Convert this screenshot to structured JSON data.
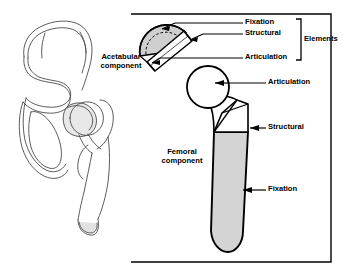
{
  "figure": {
    "background_color": "#ffffff",
    "line_color": "#000000",
    "shade_color": "#d6d6d6",
    "bone_line_color": "#444444"
  },
  "left_panel": {
    "name": "hemipelvis-and-proximal-femur-line-drawing",
    "description": "Outline drawing of hemipelvis with acetabulum and proximal femur"
  },
  "right_panel": {
    "bracket_name": "elements-enclosing-bracket",
    "acetabular": {
      "component_label": "Acetabular\ncomponent",
      "callouts": [
        {
          "label": "Fixation",
          "target": "acetabular-shell-outer-surface"
        },
        {
          "label": "Structural",
          "target": "acetabular-shell-body"
        },
        {
          "label": "Articulation",
          "target": "acetabular-liner-bearing-surface"
        }
      ],
      "group_label": "Elements"
    },
    "femoral": {
      "component_label": "Femoral\ncomponent",
      "callouts": [
        {
          "label": "Articulation",
          "target": "femoral-head"
        },
        {
          "label": "Structural",
          "target": "femoral-neck-and-proximal-stem"
        },
        {
          "label": "Fixation",
          "target": "femoral-stem-distal-surface"
        }
      ]
    }
  }
}
